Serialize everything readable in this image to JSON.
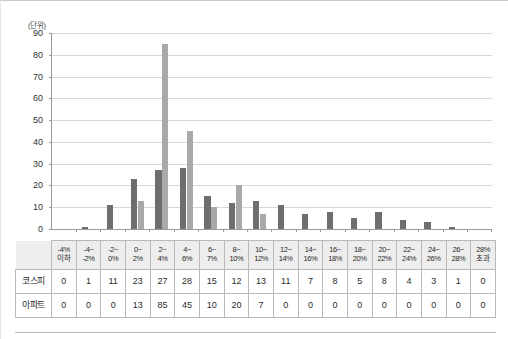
{
  "chart_data": {
    "type": "bar",
    "title": "",
    "subtitle": "",
    "unit_label": "(단위)",
    "xlabel": "",
    "ylabel": "",
    "ylim": [
      0,
      90
    ],
    "ytick_step": 10,
    "yticks": [
      0,
      10,
      20,
      30,
      40,
      50,
      60,
      70,
      80,
      90
    ],
    "grid": true,
    "legend": "none",
    "legend_position": "none",
    "categories": [
      "-4% 이하",
      "-4~ -2%",
      "-2~ 0%",
      "0~ 2%",
      "2~ 4%",
      "4~ 6%",
      "6~ 7%",
      "8~ 10%",
      "10~ 12%",
      "12~ 14%",
      "14~ 16%",
      "16~ 18%",
      "18~ 20%",
      "20~ 22%",
      "22~ 24%",
      "24~ 26%",
      "26~ 28%",
      "28% 초과"
    ],
    "category_lines": [
      [
        "-4%",
        "이하"
      ],
      [
        "-4~",
        "-2%"
      ],
      [
        "-2~",
        "0%"
      ],
      [
        "0~",
        "2%"
      ],
      [
        "2~",
        "4%"
      ],
      [
        "4~",
        "6%"
      ],
      [
        "6~",
        "7%"
      ],
      [
        "8~",
        "10%"
      ],
      [
        "10~",
        "12%"
      ],
      [
        "12~",
        "14%"
      ],
      [
        "14~",
        "16%"
      ],
      [
        "16~",
        "18%"
      ],
      [
        "18~",
        "20%"
      ],
      [
        "20~",
        "22%"
      ],
      [
        "22~",
        "24%"
      ],
      [
        "24~",
        "26%"
      ],
      [
        "26~",
        "28%"
      ],
      [
        "28%",
        "초과"
      ]
    ],
    "series": [
      {
        "name": "코스피",
        "color": "#6e6e6e",
        "values": [
          0,
          1,
          11,
          23,
          27,
          28,
          15,
          12,
          13,
          11,
          7,
          8,
          5,
          8,
          4,
          3,
          1,
          0
        ]
      },
      {
        "name": "아파트",
        "color": "#a9a9a9",
        "values": [
          0,
          0,
          0,
          13,
          85,
          45,
          10,
          20,
          7,
          0,
          0,
          0,
          0,
          0,
          0,
          0,
          0,
          0
        ]
      }
    ]
  },
  "table": {
    "corner_label": "",
    "row_labels": [
      "코스피",
      "아파트"
    ]
  },
  "colors": {
    "series_kospi": "#6e6e6e",
    "series_apartment": "#a9a9a9",
    "gridline": "#d8d8d8",
    "axis": "#9a9a9a",
    "table_header_bg": "#ededed",
    "table_border": "#b9b9b9"
  }
}
